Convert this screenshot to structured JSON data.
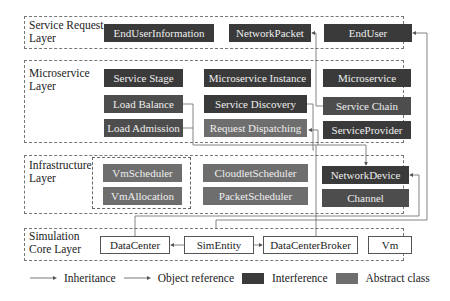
{
  "layers": {
    "service_request": {
      "label": "Service Request Layer",
      "boxes": [
        "EndUserInformation",
        "NetworkPacket",
        "EndUser"
      ]
    },
    "microservice": {
      "label": "Microservice Layer",
      "boxes": [
        "Service Stage",
        "Microservice Instance",
        "Microservice",
        "Load Balance",
        "Service Discovery",
        "Service Chain",
        "Load Admission",
        "Request Dispatching",
        "ServiceProvider"
      ]
    },
    "infrastructure": {
      "label": "Infrastructure Layer",
      "boxes": [
        "VmScheduler",
        "CloudletScheduler",
        "NetworkDevice",
        "VmAllocation",
        "PacketScheduler",
        "Channel"
      ]
    },
    "simulation_core": {
      "label": "Simulation Core Layer",
      "boxes": [
        "DataCenter",
        "SimEntity",
        "DataCenterBroker",
        "Vm"
      ]
    }
  },
  "legend": {
    "inheritance": "Inheritance",
    "object_reference": "Object reference",
    "interference": "Interference",
    "abstract_class": "Abstract class"
  },
  "colors": {
    "interference": "#3a3a3a",
    "abstract": "#6e6e6e",
    "line": "#555555"
  }
}
